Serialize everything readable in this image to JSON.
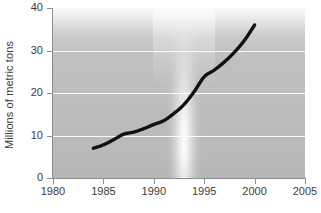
{
  "chart_data": {
    "type": "line",
    "title": "",
    "subtitle": "",
    "xlabel": "",
    "ylabel": "Millions of metric tons",
    "xlim": [
      1980,
      2005
    ],
    "ylim": [
      0,
      40
    ],
    "grid": "horizontal",
    "legend": "none",
    "x_ticks": [
      "1980",
      "1985",
      "1990",
      "1995",
      "2000",
      "2005"
    ],
    "x_tick_values": [
      1980,
      1985,
      1990,
      1995,
      2000,
      2005
    ],
    "y_ticks": [
      "0",
      "10",
      "20",
      "30",
      "40"
    ],
    "y_tick_values": [
      0,
      10,
      20,
      30,
      40
    ],
    "series": [
      {
        "name": "Millions of metric tons",
        "color": "#111111",
        "x": [
          1984,
          1985,
          1986,
          1987,
          1988,
          1989,
          1990,
          1991,
          1992,
          1993,
          1994,
          1995,
          1996,
          1997,
          1998,
          1999,
          2000
        ],
        "values": [
          7.0,
          7.8,
          9.0,
          10.3,
          10.8,
          11.6,
          12.6,
          13.5,
          15.2,
          17.3,
          20.3,
          23.8,
          25.4,
          27.3,
          29.6,
          32.4,
          36.0
        ]
      }
    ],
    "annotations": [
      {
        "name": "highlight-band",
        "type": "vertical-light-band",
        "x_center": 1993,
        "color": "#ffffff"
      }
    ],
    "plot_background": "#bfbfbf",
    "gridline_color": "#ffffff",
    "axis_color": "#8d8d8d"
  },
  "caption": {
    "clipped_text": ""
  }
}
